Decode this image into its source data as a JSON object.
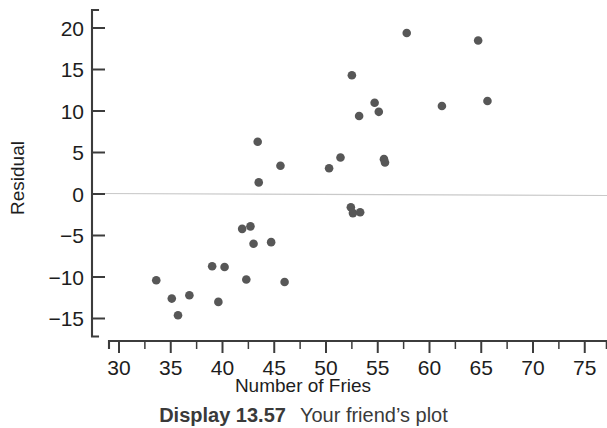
{
  "figure": {
    "caption_label": "Display 13.57",
    "caption_text": "Your friend’s plot"
  },
  "chart_data": {
    "type": "scatter",
    "title": "",
    "xlabel": "Number of Fries",
    "ylabel": "Residual",
    "xlim": [
      29,
      77
    ],
    "ylim": [
      -16.5,
      21.5
    ],
    "grid": false,
    "legend": "none",
    "reference_line": {
      "orientation": "horizontal",
      "y": 0,
      "color": "#c9c9c9"
    },
    "xticks": [
      30,
      35,
      40,
      45,
      50,
      55,
      60,
      65,
      70,
      75
    ],
    "xticks_minor": [
      32.5,
      37.5,
      42.5,
      47.5,
      52.5,
      57.5,
      62.5,
      67.5,
      72.5
    ],
    "yticks": [
      20,
      15,
      10,
      5,
      0,
      -5,
      -10,
      -15
    ],
    "xtick_labels": [
      "30",
      "35",
      "40",
      "45",
      "50",
      "55",
      "60",
      "65",
      "70",
      "75"
    ],
    "ytick_labels": [
      "20",
      "15",
      "10",
      "5",
      "0",
      "−5",
      "−10",
      "−15"
    ],
    "marker_color": "#575757",
    "marker_size": 4.3,
    "points": [
      {
        "x": 33.6,
        "y": -10.4
      },
      {
        "x": 35.1,
        "y": -12.6
      },
      {
        "x": 35.7,
        "y": -14.6
      },
      {
        "x": 36.8,
        "y": -12.2
      },
      {
        "x": 39.0,
        "y": -8.7
      },
      {
        "x": 39.6,
        "y": -13.0
      },
      {
        "x": 40.2,
        "y": -8.8
      },
      {
        "x": 41.9,
        "y": -4.2
      },
      {
        "x": 42.3,
        "y": -10.3
      },
      {
        "x": 42.7,
        "y": -3.9
      },
      {
        "x": 43.0,
        "y": -6.0
      },
      {
        "x": 43.4,
        "y": 6.3
      },
      {
        "x": 43.5,
        "y": 1.4
      },
      {
        "x": 44.7,
        "y": -5.8
      },
      {
        "x": 45.6,
        "y": 3.4
      },
      {
        "x": 46.0,
        "y": -10.6
      },
      {
        "x": 50.3,
        "y": 3.1
      },
      {
        "x": 51.4,
        "y": 4.4
      },
      {
        "x": 52.4,
        "y": -1.6
      },
      {
        "x": 52.5,
        "y": 14.3
      },
      {
        "x": 52.6,
        "y": -2.3
      },
      {
        "x": 53.2,
        "y": 9.4
      },
      {
        "x": 53.3,
        "y": -2.2
      },
      {
        "x": 54.7,
        "y": 11.0
      },
      {
        "x": 55.1,
        "y": 9.9
      },
      {
        "x": 55.6,
        "y": 4.2
      },
      {
        "x": 55.7,
        "y": 3.8
      },
      {
        "x": 57.8,
        "y": 19.4
      },
      {
        "x": 61.2,
        "y": 10.6
      },
      {
        "x": 64.7,
        "y": 18.5
      },
      {
        "x": 65.6,
        "y": 11.2
      }
    ]
  }
}
